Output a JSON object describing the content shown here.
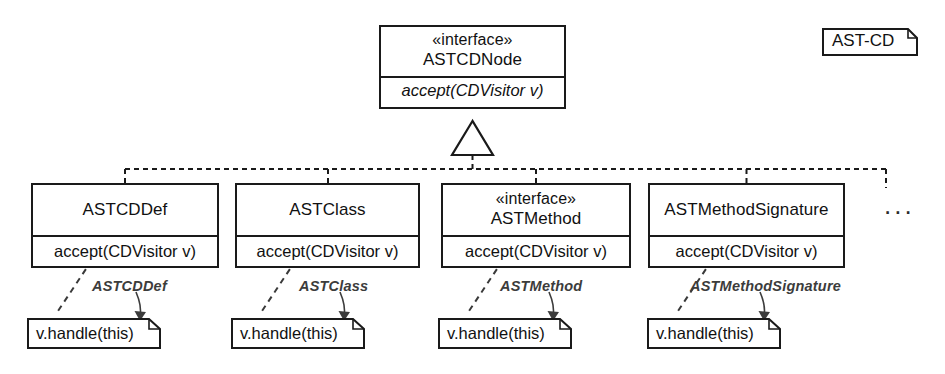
{
  "diagram": {
    "title_tag": "AST-CD",
    "kind": "uml-class-diagram",
    "more_indicator": "...",
    "line_color": "#1a1a1a",
    "annotation_color": "#3c3c3c",
    "background": "#ffffff"
  },
  "root": {
    "stereotype": "«interface»",
    "name": "ASTCDNode",
    "operation": "accept(CDVisitor v)",
    "operation_italic": true
  },
  "subclasses": [
    {
      "stereotype": "",
      "name": "ASTCDDef",
      "operation": "accept(CDVisitor v)"
    },
    {
      "stereotype": "",
      "name": "ASTClass",
      "operation": "accept(CDVisitor v)"
    },
    {
      "stereotype": "«interface»",
      "name": "ASTMethod",
      "operation": "accept(CDVisitor v)"
    },
    {
      "stereotype": "",
      "name": "ASTMethodSignature",
      "operation": "accept(CDVisitor v)"
    }
  ],
  "notes": [
    {
      "body": "v.handle(this)",
      "annotation": "ASTCDDef"
    },
    {
      "body": "v.handle(this)",
      "annotation": "ASTClass"
    },
    {
      "body": "v.handle(this)",
      "annotation": "ASTMethod"
    },
    {
      "body": "v.handle(this)",
      "annotation": "ASTMethodSignature"
    }
  ]
}
